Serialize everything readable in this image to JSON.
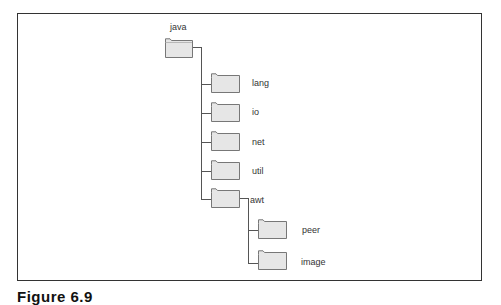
{
  "diagram": {
    "root": {
      "label": "java",
      "icon": "folder-icon"
    },
    "children": [
      {
        "label": "lang",
        "icon": "folder-icon"
      },
      {
        "label": "io",
        "icon": "folder-icon"
      },
      {
        "label": "net",
        "icon": "folder-icon"
      },
      {
        "label": "util",
        "icon": "folder-icon"
      },
      {
        "label": "awt",
        "icon": "folder-icon",
        "children": [
          {
            "label": "peer",
            "icon": "folder-icon"
          },
          {
            "label": "image",
            "icon": "folder-icon"
          }
        ]
      }
    ],
    "colors": {
      "folder_fill": "#e6e6e6",
      "folder_stroke": "#777777",
      "line": "#555555",
      "frame": "#333333"
    }
  },
  "caption": "Figure 6.9"
}
